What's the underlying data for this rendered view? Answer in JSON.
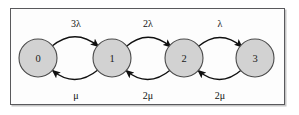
{
  "diagram": {
    "type": "markov-chain-state-diagram",
    "colors": {
      "frame_border": "#59595c",
      "node_fill": "#d2d2d2",
      "node_stroke": "#4a4a4a",
      "arrow": "#101010",
      "background": "#fdfdfd",
      "text": "#111111"
    },
    "frame": {
      "x": 10,
      "y": 8,
      "width": 275,
      "height": 97
    },
    "nodes": [
      {
        "id": "0",
        "label": "0",
        "cx": 38,
        "cy": 58,
        "r": 19
      },
      {
        "id": "1",
        "label": "1",
        "cx": 112,
        "cy": 58,
        "r": 19
      },
      {
        "id": "2",
        "label": "2",
        "cx": 184,
        "cy": 58,
        "r": 19
      },
      {
        "id": "3",
        "label": "3",
        "cx": 255,
        "cy": 58,
        "r": 19
      }
    ],
    "forward_transitions": [
      {
        "from": "0",
        "to": "1",
        "label": "3λ",
        "label_x": 76,
        "label_y": 23
      },
      {
        "from": "1",
        "to": "2",
        "label": "2λ",
        "label_x": 148,
        "label_y": 23
      },
      {
        "from": "2",
        "to": "3",
        "label": "λ",
        "label_x": 220,
        "label_y": 23
      }
    ],
    "backward_transitions": [
      {
        "from": "1",
        "to": "0",
        "label": "μ",
        "label_x": 76,
        "label_y": 95
      },
      {
        "from": "2",
        "to": "1",
        "label": "2μ",
        "label_x": 148,
        "label_y": 95
      },
      {
        "from": "3",
        "to": "2",
        "label": "2μ",
        "label_x": 220,
        "label_y": 95
      }
    ]
  }
}
